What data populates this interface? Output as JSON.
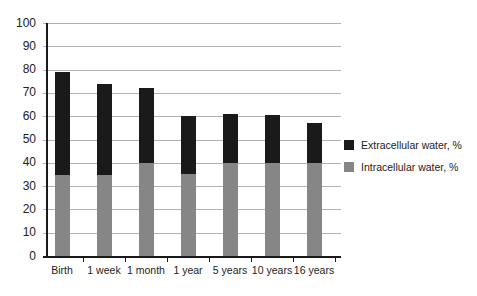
{
  "chart_data": {
    "type": "bar",
    "stacked": true,
    "title": "",
    "xlabel": "",
    "ylabel": "",
    "ylim": [
      0,
      100
    ],
    "ytick_step": 10,
    "grid": true,
    "legend_position": "right",
    "categories": [
      "Birth",
      "1 week",
      "1 month",
      "1 year",
      "5 years",
      "10 years",
      "16 years"
    ],
    "series": [
      {
        "name": "Intracellular water, %",
        "color": "#868686",
        "values": [
          35,
          35,
          40,
          35,
          40,
          40,
          40
        ]
      },
      {
        "name": "Extracellular water, %",
        "color": "#1a1a1a",
        "values": [
          44,
          39,
          32,
          25,
          21,
          20.5,
          17
        ]
      }
    ],
    "totals": [
      79,
      74,
      72,
      60,
      61,
      60.5,
      57
    ]
  },
  "colors": {
    "background": "#ffffff",
    "gridline": "#b2b2b2",
    "axis": "#1a1a1a",
    "text": "#222222"
  }
}
